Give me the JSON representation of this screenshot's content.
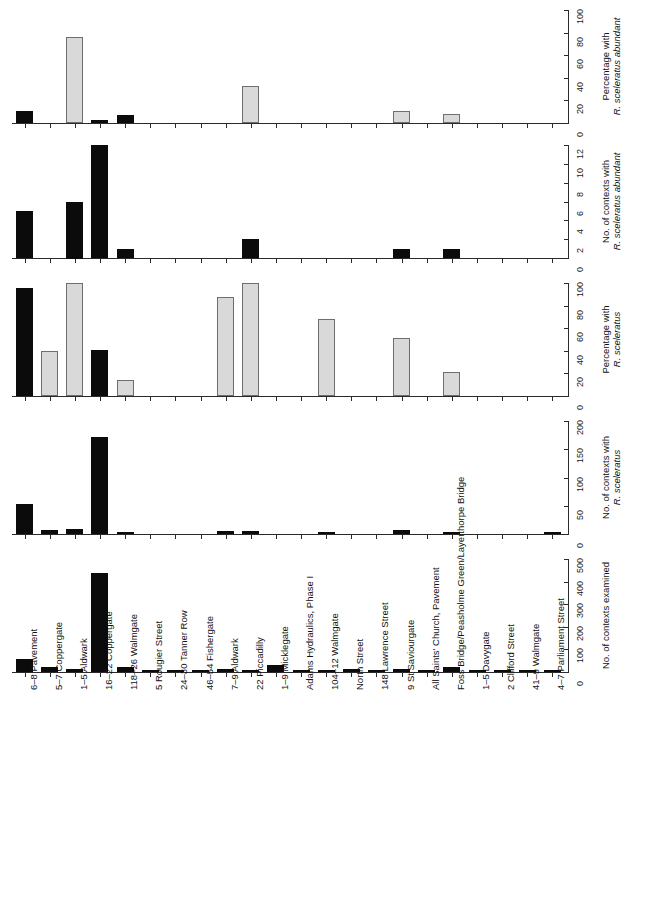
{
  "figure": {
    "width": 645,
    "height": 905,
    "bar_color_dark": "#0b0b0b",
    "bar_color_light": "#d9d9d9",
    "bar_border_light": "#6e6e6e",
    "axis_color": "#2b2b2b"
  },
  "categories": [
    "6–8 Pavement",
    "5–7 Coppergate",
    "1–5 Aldwark",
    "16–22 Coppergate",
    "118–26 Walmgate",
    "5 Rougier Street",
    "24–30 Tanner Row",
    "46–54 Fishergate",
    "7–9 Aldwark",
    "22 Piccadilly",
    "1–9 Micklegate",
    "Adams Hydraulics, Phase I",
    "104–12 Walmgate",
    "North Street",
    "148 Lawrence Street",
    "9 St Saviourgate",
    "All Saints' Church, Pavement",
    "Foss Bridge/Peasholme Green/Layerthorpe Bridge",
    "1–5 Davygate",
    "2 Clifford Street",
    "41–9 Walmgate",
    "4–7 Parliament Street"
  ],
  "chart_data": [
    {
      "id": "pct-abundant",
      "type": "bar",
      "title": "",
      "ylabel": "Percentage with R. sceleratus abundant",
      "ylabel_line1": "Percentage with",
      "ylabel_line2": "R. sceleratus abundant",
      "ylabel_italic_part": "R. sceleratus abundant",
      "ylim": [
        0,
        100
      ],
      "yticks": [
        0,
        20,
        40,
        60,
        80,
        100
      ],
      "ytick_labels": [
        "0",
        "20",
        "40",
        "60",
        "80",
        "100"
      ],
      "grid": false,
      "legend": "none",
      "categories_ref": "categories",
      "values": [
        11,
        0,
        76,
        3,
        7,
        0,
        0,
        0,
        0,
        33,
        0,
        0,
        0,
        0,
        0,
        11,
        0,
        8,
        0,
        0,
        0,
        0
      ],
      "colors": [
        "dark",
        "light",
        "light",
        "dark",
        "dark",
        "light",
        "light",
        "light",
        "light",
        "light",
        "light",
        "light",
        "light",
        "light",
        "light",
        "light",
        "light",
        "light",
        "light",
        "light",
        "light",
        "light"
      ]
    },
    {
      "id": "n-contexts-abundant",
      "type": "bar",
      "title": "",
      "ylabel": "No. of contexts with R. sceleratus abundant",
      "ylabel_line1": "No. of contexts with",
      "ylabel_line2": "R. sceleratus abundant",
      "ylabel_italic_part": "R. sceleratus abundant",
      "ylim": [
        0,
        12
      ],
      "yticks": [
        0,
        2,
        4,
        6,
        8,
        10,
        12
      ],
      "ytick_labels": [
        "0",
        "2",
        "4",
        "6",
        "8",
        "10",
        "12"
      ],
      "grid": false,
      "legend": "none",
      "categories_ref": "categories",
      "values": [
        5,
        0,
        6,
        12,
        1,
        0,
        0,
        0,
        0,
        2,
        0,
        0,
        0,
        0,
        0,
        1,
        0,
        1,
        0,
        0,
        0,
        0
      ],
      "colors": [
        "dark",
        "dark",
        "dark",
        "dark",
        "dark",
        "dark",
        "dark",
        "dark",
        "dark",
        "dark",
        "dark",
        "dark",
        "dark",
        "dark",
        "dark",
        "dark",
        "dark",
        "dark",
        "dark",
        "dark",
        "dark",
        "dark"
      ]
    },
    {
      "id": "pct-sceleratus",
      "type": "bar",
      "title": "",
      "ylabel": "Percentage with R. sceleratus",
      "ylabel_line1": "Percentage  with",
      "ylabel_line2": "R. sceleratus",
      "ylabel_italic_part": "R. sceleratus",
      "ylim": [
        0,
        100
      ],
      "yticks": [
        0,
        20,
        40,
        60,
        80,
        100
      ],
      "ytick_labels": [
        "0",
        "20",
        "40",
        "60",
        "80",
        "100"
      ],
      "grid": false,
      "legend": "none",
      "categories_ref": "categories",
      "values": [
        96,
        40,
        100,
        41,
        14,
        0,
        0,
        0,
        88,
        100,
        0,
        0,
        68,
        0,
        0,
        51,
        0,
        21,
        0,
        0,
        0,
        0
      ],
      "colors": [
        "dark",
        "light",
        "light",
        "dark",
        "light",
        "light",
        "light",
        "light",
        "light",
        "light",
        "light",
        "light",
        "light",
        "light",
        "light",
        "light",
        "light",
        "light",
        "light",
        "light",
        "light",
        "light"
      ]
    },
    {
      "id": "n-contexts-sceleratus",
      "type": "bar",
      "title": "",
      "ylabel": "No. of contexts with R. sceleratus",
      "ylabel_line1": "No. of contexts with",
      "ylabel_line2": "R. sceleratus",
      "ylabel_italic_part": "R. sceleratus",
      "ylim": [
        0,
        200
      ],
      "yticks": [
        0,
        50,
        100,
        150,
        200
      ],
      "ytick_labels": [
        "0",
        "50",
        "100",
        "150",
        "200"
      ],
      "grid": false,
      "legend": "none",
      "categories_ref": "categories",
      "values": [
        53,
        7,
        9,
        172,
        3,
        0,
        0,
        0,
        6,
        6,
        0,
        0,
        2,
        0,
        0,
        7,
        0,
        4,
        0,
        0,
        0,
        1
      ],
      "colors": [
        "dark",
        "dark",
        "dark",
        "dark",
        "dark",
        "dark",
        "dark",
        "dark",
        "dark",
        "dark",
        "dark",
        "dark",
        "dark",
        "dark",
        "dark",
        "dark",
        "dark",
        "dark",
        "dark",
        "dark",
        "dark",
        "dark"
      ]
    },
    {
      "id": "n-contexts-examined",
      "type": "bar",
      "title": "",
      "ylabel": "No. of contexts examined",
      "ylabel_line1": "No. of contexts examined",
      "ylabel_line2": "",
      "ylabel_italic_part": "",
      "ylim": [
        0,
        500
      ],
      "yticks": [
        0,
        100,
        200,
        300,
        400,
        500
      ],
      "ytick_labels": [
        "0",
        "100",
        "200",
        "300",
        "400",
        "500"
      ],
      "grid": false,
      "legend": "none",
      "categories_ref": "categories",
      "values": [
        57,
        22,
        14,
        437,
        24,
        7,
        11,
        9,
        12,
        10,
        32,
        5,
        8,
        13,
        4,
        15,
        10,
        23,
        3,
        10,
        11,
        7
      ],
      "colors": [
        "dark",
        "dark",
        "dark",
        "dark",
        "dark",
        "dark",
        "dark",
        "dark",
        "dark",
        "dark",
        "dark",
        "dark",
        "dark",
        "dark",
        "dark",
        "dark",
        "dark",
        "dark",
        "dark",
        "dark",
        "dark",
        "dark"
      ]
    }
  ]
}
